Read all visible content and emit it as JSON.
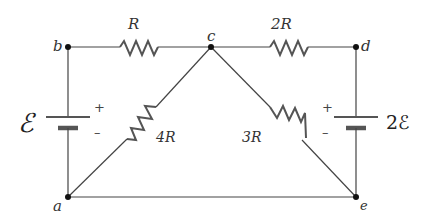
{
  "diagram": {
    "type": "circuit",
    "nodes": [
      {
        "id": "a",
        "label": "a"
      },
      {
        "id": "b",
        "label": "b"
      },
      {
        "id": "c",
        "label": "c"
      },
      {
        "id": "d",
        "label": "d"
      },
      {
        "id": "e",
        "label": "e"
      }
    ],
    "resistors": [
      {
        "id": "r_bc",
        "label": "R",
        "from": "b",
        "to": "c"
      },
      {
        "id": "r_cd",
        "label": "2R",
        "from": "c",
        "to": "d"
      },
      {
        "id": "r_ca",
        "label": "4R",
        "from": "c",
        "to": "a"
      },
      {
        "id": "r_ce",
        "label": "3R",
        "from": "c",
        "to": "e"
      }
    ],
    "batteries": [
      {
        "id": "bat_left",
        "label": "ℰ",
        "emf": "ℰ",
        "between": [
          "b",
          "a"
        ],
        "plus": "+",
        "minus": "–"
      },
      {
        "id": "bat_right",
        "label": "2ℰ",
        "emf": "2ℰ",
        "between": [
          "d",
          "e"
        ],
        "plus": "+",
        "minus": "–"
      }
    ],
    "wires": [
      {
        "from": "a",
        "to": "e"
      }
    ]
  }
}
